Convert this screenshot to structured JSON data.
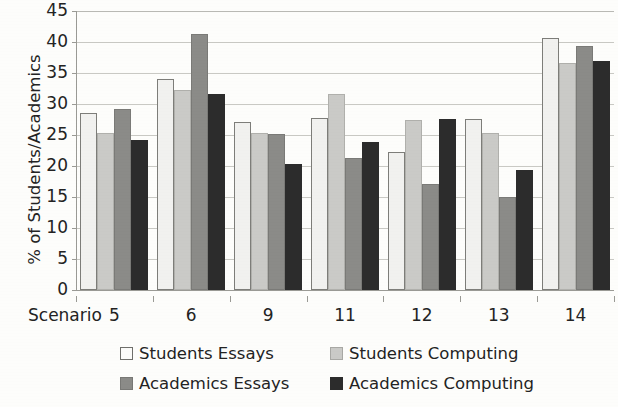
{
  "chart_data": {
    "type": "bar",
    "title": "",
    "xlabel": "Scenario",
    "ylabel": "% of Students/Academics",
    "categories": [
      "5",
      "6",
      "9",
      "11",
      "12",
      "13",
      "14"
    ],
    "ylim": [
      0,
      45
    ],
    "yticks": [
      0,
      5,
      10,
      15,
      20,
      25,
      30,
      35,
      40,
      45
    ],
    "grid": true,
    "legend_position": "bottom",
    "series": [
      {
        "name": "Students Essays",
        "color": "#f1f1ef",
        "values": [
          28.6,
          34.1,
          27.1,
          27.7,
          22.3,
          27.6,
          40.6
        ]
      },
      {
        "name": "Students Computing",
        "color": "#cacac7",
        "values": [
          25.3,
          32.2,
          25.3,
          31.6,
          27.4,
          25.3,
          36.6
        ]
      },
      {
        "name": "Academics Essays",
        "color": "#8b8b88",
        "values": [
          29.2,
          41.3,
          25.2,
          21.3,
          17.1,
          15.0,
          39.3
        ]
      },
      {
        "name": "Academics Computing",
        "color": "#2c2c2c",
        "values": [
          24.2,
          31.6,
          20.4,
          23.8,
          27.6,
          19.3,
          36.9
        ]
      }
    ]
  },
  "axis": {
    "scenario_prefix": "Scenario",
    "y_title": "% of Students/Academics"
  },
  "legend": {
    "items": [
      {
        "label": "Students Essays",
        "swatch": "students-essays-swatch"
      },
      {
        "label": "Students Computing",
        "swatch": "students-computing-swatch"
      },
      {
        "label": "Academics Essays",
        "swatch": "academics-essays-swatch"
      },
      {
        "label": "Academics Computing",
        "swatch": "academics-computing-swatch"
      }
    ]
  }
}
